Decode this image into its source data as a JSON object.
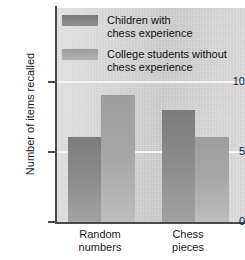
{
  "chart_data": {
    "type": "bar",
    "title": "",
    "subtitle": "",
    "xlabel": "",
    "ylabel": "Number of items recalled",
    "categories": [
      "Random numbers",
      "Chess pieces"
    ],
    "category_lines": [
      [
        "Random",
        "numbers"
      ],
      [
        "Chess",
        "pieces"
      ]
    ],
    "series": [
      {
        "name": "Children with chess experience",
        "name_lines": [
          "Children with",
          "chess experience"
        ],
        "color": "#808080",
        "values": [
          6.1,
          8.0
        ]
      },
      {
        "name": "College students without chess experience",
        "name_lines": [
          "College students without",
          "chess experience"
        ],
        "color": "#a8a8a8",
        "values": [
          9.1,
          6.1
        ]
      }
    ],
    "ylim": [
      0,
      15.3
    ],
    "yticks": [
      0,
      5,
      10
    ],
    "ytick_labels": [
      "0",
      "5",
      "10"
    ],
    "gridlines": [
      5,
      10
    ],
    "grid": true,
    "grid_color": "#f4f4f4",
    "legend_position": "upper-left-inside",
    "plot_background": "#d3d3d3"
  },
  "axis": {
    "y_title": "Number of items recalled",
    "tick_0": "0",
    "tick_5": "5",
    "tick_10": "10"
  },
  "legend": {
    "entry_1_line_1": "Children with",
    "entry_1_line_2": "chess experience",
    "entry_2_line_1": "College students without",
    "entry_2_line_2": "chess experience"
  },
  "xlabels": {
    "cat_1_line_1": "Random",
    "cat_1_line_2": "numbers",
    "cat_2_line_1": "Chess",
    "cat_2_line_2": "pieces"
  }
}
